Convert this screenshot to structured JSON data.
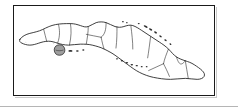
{
  "figure": {
    "kind": "outline-map",
    "has_labels": false,
    "has_title": false,
    "has_legend": false,
    "has_scale_bar": false,
    "has_north_arrow": false
  },
  "style": {
    "page_background": "#ffffff",
    "frame_border_color": "#1a1a1a",
    "frame_border_width_px": 1.5,
    "frame_shadow_color": "#c9c9c9",
    "coastline_color": "#1a1a1a",
    "province_boundary_color": "#2b2b2b",
    "island_fill": "#ffffff",
    "highlight_island_fill": "#9e9e9e",
    "cay_dot_color": "#2b2b2b",
    "bottom_rule_color": "#b5b5b5"
  },
  "frame": {
    "x": 13,
    "y": 5,
    "width": 202,
    "height": 91
  },
  "features": {
    "mainland": {
      "name": "Cuba mainland",
      "orientation": "west-northwest to east-southeast elongated arc"
    },
    "highlight_island": {
      "name": "Isla de la Juventud",
      "fill": "#9e9e9e",
      "position": "southwest of mainland"
    },
    "cay_groups": [
      {
        "name": "south-southwest cays",
        "count": 3
      },
      {
        "name": "north-central cays (Archipielago Sabana-Camagueey)",
        "count": 9
      },
      {
        "name": "south-central cays (Jardines de la Reina)",
        "count": 7
      }
    ],
    "internal_boundaries_count": 14
  },
  "bottom_rule": {
    "y": 106,
    "width": 238,
    "height": 1
  }
}
